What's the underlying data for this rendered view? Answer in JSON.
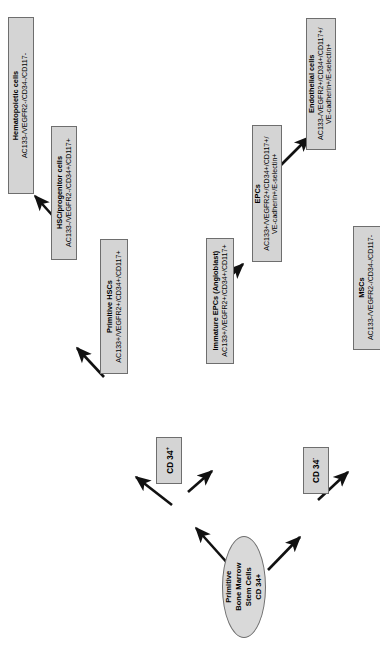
{
  "diagram": {
    "orientation": "rotated-90-ccw",
    "root": {
      "label_line1": "Primitive",
      "label_line2": "Bone Marrow",
      "label_line3": "Stem Cells",
      "label_line4": "CD 34+"
    },
    "chips": [
      {
        "id": "cd34pos",
        "label": "CD 34",
        "sign": "+"
      },
      {
        "id": "cd34neg",
        "label": "CD 34",
        "sign": "-"
      }
    ],
    "nodes": [
      {
        "id": "hematopoietic-cells",
        "title": "Hematopoietic cells",
        "markers": "AC133-/VEGFR2-/CD34-/CD117-"
      },
      {
        "id": "hsc-progenitor-cells",
        "title": "HSC/progenitor cells",
        "markers": "AC133-/VEGFR2-/CD34+/CD117+"
      },
      {
        "id": "primitive-hscs",
        "title": "Primitive HSCs",
        "markers": "AC133+/VEGFR2+/CD34+/CD117+"
      },
      {
        "id": "immature-epcs",
        "title": "Immature EPCs (Angioblast)",
        "markers": "AC133+/VEGFR2+/CD34+/CD117+"
      },
      {
        "id": "epcs",
        "title": "EPCs",
        "markers_line1": "AC133+/VEGFR2+/CD34+/CD117+/",
        "markers_line2": "VE-cadherin+/E-selectin+"
      },
      {
        "id": "endothelial-cells",
        "title": "Endothelial cells",
        "markers_line1": "AC133-/VEGFR2+/CD34+/CD117+/",
        "markers_line2": "VE-cadherin+/E-selectin+"
      },
      {
        "id": "mscs",
        "title": "MSCs",
        "markers": "AC133-/VEGFR2-/CD34-/CD117-"
      }
    ],
    "colors": {
      "box_fill": "#d4d4d4",
      "box_border": "#6e6e6e",
      "arrow": "#111111",
      "background": "#ffffff",
      "text": "#000000"
    },
    "edges": [
      {
        "from": "root",
        "to": "cd34pos"
      },
      {
        "from": "root",
        "to": "cd34neg"
      },
      {
        "from": "cd34pos",
        "to": "primitive-hscs"
      },
      {
        "from": "cd34pos",
        "to": "immature-epcs"
      },
      {
        "from": "cd34neg",
        "to": "mscs"
      },
      {
        "from": "primitive-hscs",
        "to": "hsc-progenitor-cells"
      },
      {
        "from": "hsc-progenitor-cells",
        "to": "hematopoietic-cells"
      },
      {
        "from": "immature-epcs",
        "to": "epcs"
      },
      {
        "from": "epcs",
        "to": "endothelial-cells"
      }
    ]
  }
}
